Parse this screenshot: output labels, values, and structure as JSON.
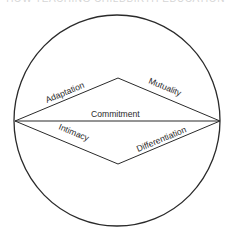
{
  "header": {
    "running_title": "HOW TEACHING CHILDBIRTH EDUCATION"
  },
  "diagram": {
    "type": "circle-with-diamond",
    "stroke_color": "#2a2a2a",
    "labels": {
      "top_left_edge": "Adaptation",
      "top_right_edge": "Mutuality",
      "center_line": "Commitment",
      "bottom_left_edge": "Intimacy",
      "bottom_right_edge": "Differentiation"
    }
  }
}
